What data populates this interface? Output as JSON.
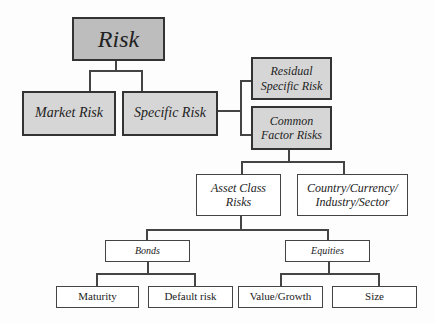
{
  "diagram": {
    "title": "Risk",
    "nodes": {
      "risk": "Risk",
      "market_risk": "Market Risk",
      "specific_risk": "Specific Risk",
      "residual_specific_risk": "Residual Specific Risk",
      "common_factor_risks": "Common Factor Risks",
      "asset_class_risks": "Asset Class Risks",
      "country_currency": "Country/Currency/ Industry/Sector",
      "bonds": "Bonds",
      "equities": "Equities",
      "maturity": "Maturity",
      "default_risk": "Default risk",
      "value_growth": "Value/Growth",
      "size": "Size"
    },
    "edges": [
      [
        "Risk",
        "Market Risk"
      ],
      [
        "Risk",
        "Specific Risk"
      ],
      [
        "Specific Risk",
        "Residual Specific Risk"
      ],
      [
        "Specific Risk",
        "Common Factor Risks"
      ],
      [
        "Common Factor Risks",
        "Asset Class Risks"
      ],
      [
        "Common Factor Risks",
        "Country/Currency/ Industry/Sector"
      ],
      [
        "Asset Class Risks",
        "Bonds"
      ],
      [
        "Asset Class Risks",
        "Equities"
      ],
      [
        "Bonds",
        "Maturity"
      ],
      [
        "Bonds",
        "Default risk"
      ],
      [
        "Equities",
        "Value/Growth"
      ],
      [
        "Equities",
        "Size"
      ]
    ],
    "colors": {
      "top_fill": "#bdbdbd",
      "level_fill": "#d6d6d6",
      "leaf_fill": "#ffffff",
      "stroke": "#333333"
    }
  }
}
